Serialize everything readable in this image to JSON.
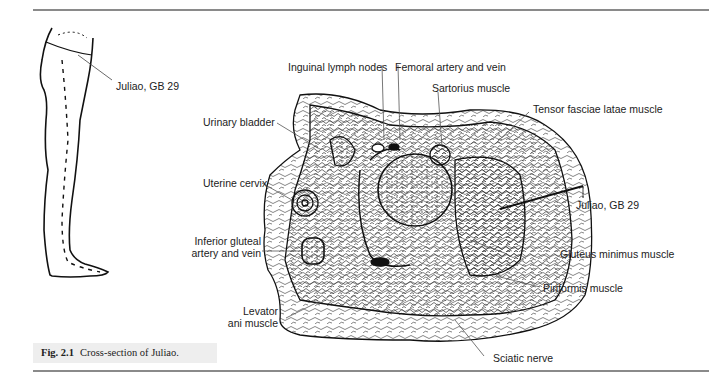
{
  "figure": {
    "number": "Fig. 2.1",
    "caption": "Cross-section of Juliao."
  },
  "leg_figure": {
    "label": "Juliao, GB 29"
  },
  "cross_section": {
    "labels": {
      "inguinal_lymph_nodes": "Inguinal lymph nodes",
      "femoral_artery_vein": "Femoral artery and vein",
      "sartorius": "Sartorius muscle",
      "tensor_fasciae_latae": "Tensor fasciae latae muscle",
      "urinary_bladder": "Urinary bladder",
      "uterine_cervix": "Uterine cervix",
      "juliao_point": "Juliao, GB 29",
      "inferior_gluteal_line1": "Inferior gluteal",
      "inferior_gluteal_line2": "artery and vein",
      "gluteus_minimus": "Gluteus minimus muscle",
      "levator_line1": "Levator",
      "levator_line2": "ani muscle",
      "piriformis": "Piriformis muscle",
      "sciatic_nerve": "Sciatic nerve"
    }
  },
  "colors": {
    "ink": "#222222",
    "rule": "#8a8a8a",
    "caption_bg": "#eeeeee"
  }
}
